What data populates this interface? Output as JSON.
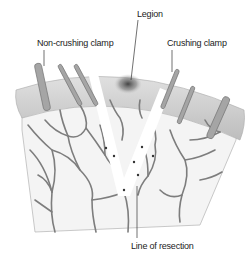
{
  "labels": {
    "legion": "Legion",
    "non_crushing_clamp": "Non-crushing clamp",
    "crushing_clamp": "Crushing clamp",
    "line_of_resection": "Line of resection"
  },
  "colors": {
    "background": "#ffffff",
    "tissue_fill": "#f3f3f3",
    "capsule_rim": "#c9c9c9",
    "vessel": "#7a7a7a",
    "clamp": "#9a9a9a",
    "lesion": "#555555",
    "leader_line": "#333333"
  }
}
